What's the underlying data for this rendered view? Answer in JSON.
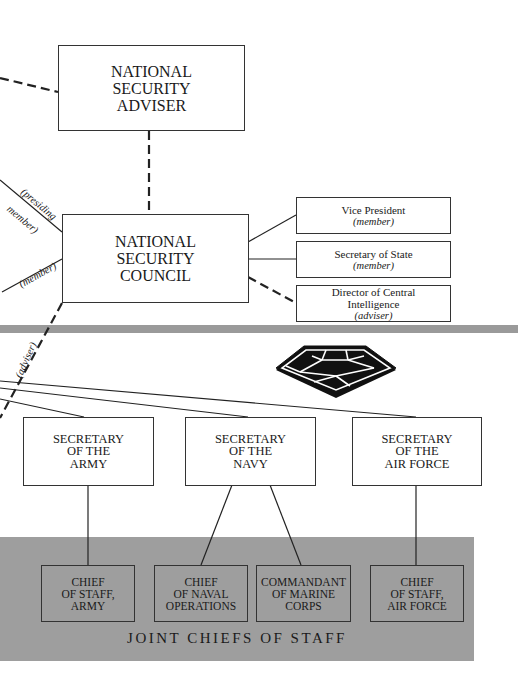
{
  "diagram": {
    "nsa": {
      "lines": [
        "NATIONAL",
        "SECURITY",
        "ADVISER"
      ]
    },
    "nsc": {
      "lines": [
        "NATIONAL",
        "SECURITY",
        "COUNCIL"
      ]
    },
    "nsc_members": [
      {
        "title": "Vice President",
        "role": "(member)"
      },
      {
        "title": "Secretary of State",
        "role": "(member)"
      },
      {
        "title_line1": "Director of Central",
        "title_line2": "Intelligence",
        "role": "(adviser)"
      }
    ],
    "left_labels": {
      "presiding_line1": "(presiding",
      "presiding_line2": "member)",
      "member": "(member)",
      "adviser": "(adviser)"
    },
    "pentagon_icon": "pentagon-building-icon",
    "secretaries": [
      {
        "lines": [
          "SECRETARY",
          "OF THE",
          "ARMY"
        ]
      },
      {
        "lines": [
          "SECRETARY",
          "OF THE",
          "NAVY"
        ]
      },
      {
        "lines": [
          "SECRETARY",
          "OF THE",
          "AIR FORCE"
        ]
      }
    ],
    "chiefs": [
      {
        "lines": [
          "CHIEF",
          "OF STAFF,",
          "ARMY"
        ]
      },
      {
        "lines": [
          "CHIEF",
          "OF NAVAL",
          "OPERATIONS"
        ]
      },
      {
        "lines": [
          "COMMANDANT",
          "OF MARINE",
          "CORPS"
        ]
      },
      {
        "lines": [
          "CHIEF",
          "OF STAFF,",
          "AIR FORCE"
        ]
      }
    ],
    "jcs_title": "JOINT CHIEFS OF STAFF",
    "colors": {
      "band": "#9a9a9a",
      "jcs_panel": "#9e9e9e",
      "line": "#222222"
    }
  }
}
